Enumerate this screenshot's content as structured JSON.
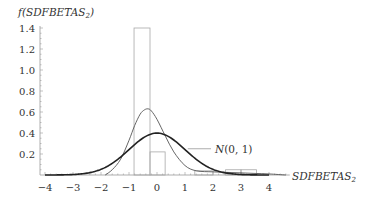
{
  "chart_data": {
    "type": "bar",
    "title": "",
    "xlabel": "SDFBETAS",
    "xlabel_subscript": "2",
    "ylabel": "f(SDFBETAS",
    "ylabel_subscript": "2",
    "ylabel_suffix": ")",
    "xlim": [
      -4,
      4.6
    ],
    "ylim": [
      0,
      1.4
    ],
    "xticks": [
      -4,
      -3,
      -2,
      -1,
      0,
      1,
      2,
      3,
      4
    ],
    "xtick_labels": [
      "−4",
      "−3",
      "−2",
      "−1",
      "0",
      "1",
      "2",
      "3",
      "4"
    ],
    "yticks": [
      0.2,
      0.4,
      0.6,
      0.8,
      1.0,
      1.2,
      1.4
    ],
    "ytick_labels": [
      "0.2",
      "0.4",
      "0.6",
      "0.8",
      "1.0",
      "1.2",
      "1.4"
    ],
    "grid": false,
    "histogram": {
      "bins": [
        {
          "x0": -0.82,
          "x1": -0.25,
          "height": 1.4
        },
        {
          "x0": -0.25,
          "x1": 0.29,
          "height": 0.22
        },
        {
          "x0": 1.35,
          "x1": 2.0,
          "height": 0.04
        },
        {
          "x0": 2.45,
          "x1": 3.0,
          "height": 0.05
        },
        {
          "x0": 3.0,
          "x1": 3.55,
          "height": 0.05
        }
      ]
    },
    "series": [
      {
        "name": "kernel density",
        "style": "thin",
        "x": [
          -1.85,
          -1.6,
          -1.3,
          -1.0,
          -0.8,
          -0.6,
          -0.45,
          -0.32,
          -0.2,
          0.0,
          0.3,
          0.6,
          1.0,
          1.4,
          2.0,
          2.5,
          3.0,
          3.5,
          4.0,
          4.6
        ],
        "values": [
          0.0,
          0.05,
          0.15,
          0.33,
          0.47,
          0.58,
          0.62,
          0.63,
          0.61,
          0.53,
          0.37,
          0.22,
          0.09,
          0.04,
          0.03,
          0.025,
          0.02,
          0.015,
          0.01,
          0.0
        ]
      },
      {
        "name": "N(0, 1)",
        "style": "thick",
        "function": "standard_normal_pdf",
        "x_range": [
          -4,
          4
        ]
      }
    ],
    "annotations": [
      {
        "text": "N(0, 1)",
        "x": 2.0,
        "y": 0.25,
        "leader_from": [
          1.1,
          0.25
        ]
      }
    ]
  }
}
